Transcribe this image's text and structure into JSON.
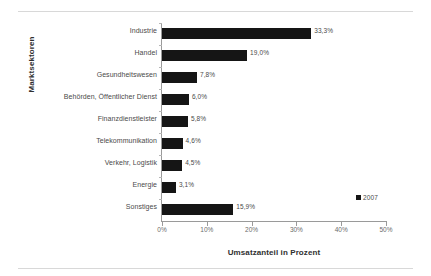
{
  "chart_data": {
    "type": "bar",
    "orientation": "horizontal",
    "title": "",
    "xlabel": "Umsatzanteil in Prozent",
    "ylabel": "Marktsektoren",
    "categories": [
      "Industrie",
      "Handel",
      "Gesundheitswesen",
      "Behörden, Öffentlicher Dienst",
      "Finanzdienstleister",
      "Telekommunikation",
      "Verkehr, Logistik",
      "Energie",
      "Sonstiges"
    ],
    "values": [
      33.3,
      19.0,
      7.8,
      6.0,
      5.8,
      4.6,
      4.5,
      3.1,
      15.9
    ],
    "value_labels": [
      "33,3%",
      "19,0%",
      "7,8%",
      "6,0%",
      "5,8%",
      "4,6%",
      "4,5%",
      "3,1%",
      "15,9%"
    ],
    "series": [
      {
        "name": "2007",
        "values": [
          33.3,
          19.0,
          7.8,
          6.0,
          5.8,
          4.6,
          4.5,
          3.1,
          15.9
        ],
        "color": "#151515"
      }
    ],
    "xlim": [
      0,
      50
    ],
    "xticks": [
      0,
      10,
      20,
      30,
      40,
      50
    ],
    "xticklabels": [
      "0%",
      "10%",
      "20%",
      "30%",
      "40%",
      "50%"
    ],
    "grid": false,
    "legend": {
      "position": "right",
      "entries": [
        {
          "label": "2007",
          "color": "#151515"
        }
      ]
    },
    "bar_color": "#151515",
    "axis_color": "#9a9a9a"
  }
}
